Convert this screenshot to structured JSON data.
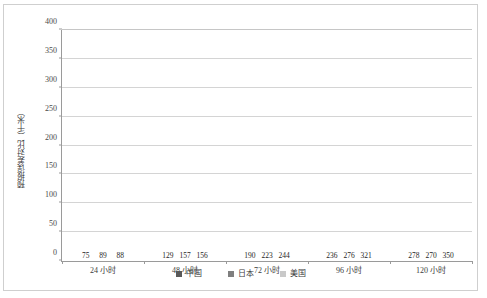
{
  "chart_data": {
    "type": "bar",
    "title": "",
    "subtitle": "",
    "xlabel": "",
    "ylabel": "预报误差对比（千米）",
    "categories": [
      "24 小时",
      "48 小时",
      "72 小时",
      "96 小时",
      "120 小时"
    ],
    "series": [
      {
        "name": "中国",
        "color": "#595959",
        "values": [
          75,
          129,
          190,
          236,
          278
        ]
      },
      {
        "name": "日本",
        "color": "#7f7f7f",
        "values": [
          89,
          157,
          223,
          276,
          270
        ]
      },
      {
        "name": "美国",
        "color": "#c9c9c9",
        "values": [
          88,
          156,
          244,
          321,
          350
        ]
      }
    ],
    "ylim": [
      0,
      400
    ],
    "ytick_step": 50,
    "yticks": [
      "0",
      "50",
      "100",
      "150",
      "200",
      "250",
      "300",
      "350",
      "400"
    ],
    "grid": true,
    "grid_axis": "y",
    "legend_position": "bottom",
    "data_labels": true,
    "plot_background": "#ffffff",
    "grid_color": "#d4d4d4",
    "axis_color": "#9a9a9a",
    "border_color": "#cfcfcf"
  }
}
